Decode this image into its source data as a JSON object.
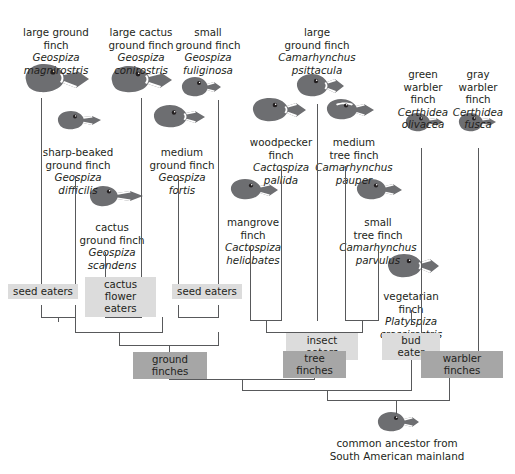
{
  "figure": {
    "type": "phylogenetic-tree",
    "root_label": "common ancestor from\nSouth American mainland"
  },
  "taxa": [
    {
      "id": "magnirostris",
      "common": "large ground\nfinch",
      "sci": "Geospiza\nmagnirostris"
    },
    {
      "id": "difficilis",
      "common": "sharp-beaked\nground finch",
      "sci": "Geospiza\ndifficilis"
    },
    {
      "id": "scandens",
      "common": "cactus\nground finch",
      "sci": "Geospiza\nscandens"
    },
    {
      "id": "conirostris",
      "common": "large cactus\nground finch",
      "sci": "Geospiza\nconirostris"
    },
    {
      "id": "fortis",
      "common": "medium\nground finch",
      "sci": "Geospiza\nfortis"
    },
    {
      "id": "fuliginosa",
      "common": "small\nground finch",
      "sci": "Geospiza\nfuliginosa"
    },
    {
      "id": "heliobates",
      "common": "mangrove\nfinch",
      "sci": "Cactospiza\nheliobates"
    },
    {
      "id": "pallida",
      "common": "woodpecker\nfinch",
      "sci": "Cactospiza\npallida"
    },
    {
      "id": "psittacula",
      "common": "large\nground finch",
      "sci": "Camarhynchus\npsittacula"
    },
    {
      "id": "pauper",
      "common": "medium\ntree finch",
      "sci": "Camarhynchus\npauper"
    },
    {
      "id": "parvulus",
      "common": "small\ntree finch",
      "sci": "Camarhynchus\nparvulus"
    },
    {
      "id": "crassirostris",
      "common": "vegetarian\nfinch",
      "sci": "Platyspiza\ncrassirostris"
    },
    {
      "id": "olivacea",
      "common": "green\nwarbler\nfinch",
      "sci": "Certhidea\nolivacea"
    },
    {
      "id": "fusca",
      "common": "gray\nwarbler\nfinch",
      "sci": "Certhidea\nfusca"
    }
  ],
  "categories": [
    {
      "id": "seed-eaters-left",
      "label": "seed eaters",
      "shade": "light"
    },
    {
      "id": "cactus-flower",
      "label": "cactus flower\neaters",
      "shade": "light"
    },
    {
      "id": "seed-eaters-right",
      "label": "seed eaters",
      "shade": "light"
    },
    {
      "id": "insect-eaters",
      "label": "insect eaters",
      "shade": "light"
    },
    {
      "id": "bud-eater",
      "label": "bud eater",
      "shade": "light"
    },
    {
      "id": "ground-finches",
      "label": "ground finches",
      "shade": "dark"
    },
    {
      "id": "tree-finches",
      "label": "tree finches",
      "shade": "dark"
    },
    {
      "id": "warbler-finches",
      "label": "warbler finches",
      "shade": "dark"
    }
  ],
  "colors": {
    "line": "#58595b",
    "bird_fill": "#6d6e71",
    "box_light": "#dcdcdc",
    "box_dark": "#a6a6a6",
    "text": "#231f20"
  }
}
